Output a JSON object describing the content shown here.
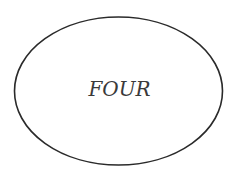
{
  "diagram": {
    "shape": "ellipse",
    "label": "FOUR",
    "stroke_color": "#2a2a2a",
    "fill_color": "#ffffff",
    "text_color": "#3a3a3a"
  }
}
